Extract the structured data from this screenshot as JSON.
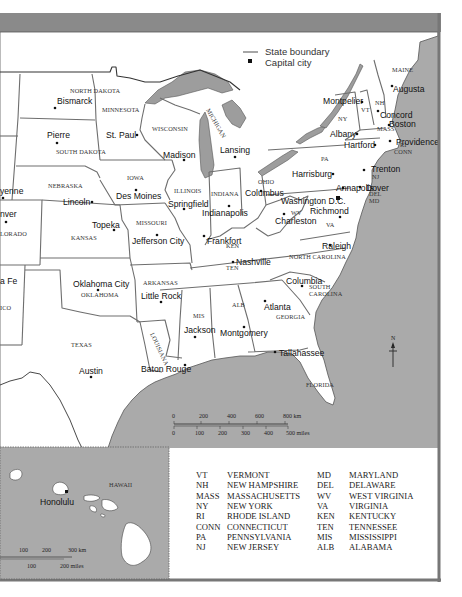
{
  "legend": {
    "items": [
      {
        "icon": "state-boundary-line-icon",
        "label": "State boundary"
      },
      {
        "icon": "capital-city-square-icon",
        "label": "Capital city"
      }
    ]
  },
  "states": [
    {
      "name": "NORTH DAKOTA",
      "x": 70,
      "y": 93
    },
    {
      "name": "SOUTH DAKOTA",
      "x": 56,
      "y": 154
    },
    {
      "name": "MINNESOTA",
      "x": 102,
      "y": 112
    },
    {
      "name": "WISCONSIN",
      "x": 152,
      "y": 131
    },
    {
      "name": "MICHIGAN",
      "x": 206,
      "y": 110,
      "rotate": 60
    },
    {
      "name": "NEBRASKA",
      "x": 48,
      "y": 188
    },
    {
      "name": "IOWA",
      "x": 127,
      "y": 180
    },
    {
      "name": "ILLINOIS",
      "x": 174,
      "y": 193
    },
    {
      "name": "INDIANA",
      "x": 211,
      "y": 196
    },
    {
      "name": "OHIO",
      "x": 258,
      "y": 184
    },
    {
      "name": "PA",
      "x": 321,
      "y": 161
    },
    {
      "name": "NY",
      "x": 338,
      "y": 121
    },
    {
      "name": "VT",
      "x": 361,
      "y": 112
    },
    {
      "name": "NH",
      "x": 375,
      "y": 105
    },
    {
      "name": "MAINE",
      "x": 392,
      "y": 72
    },
    {
      "name": "MASS",
      "x": 377,
      "y": 131
    },
    {
      "name": "RI",
      "x": 400,
      "y": 147
    },
    {
      "name": "CONN",
      "x": 394,
      "y": 154
    },
    {
      "name": "NJ",
      "x": 372,
      "y": 179
    },
    {
      "name": "DEL",
      "x": 369,
      "y": 196
    },
    {
      "name": "MD",
      "x": 369,
      "y": 203
    },
    {
      "name": "WV",
      "x": 291,
      "y": 215
    },
    {
      "name": "VA",
      "x": 326,
      "y": 227
    },
    {
      "name": "KANSAS",
      "x": 71,
      "y": 240
    },
    {
      "name": "MISSOURI",
      "x": 136,
      "y": 225
    },
    {
      "name": "COLORADO",
      "x": 0,
      "y": 235
    },
    {
      "name": "KEN",
      "x": 226,
      "y": 248
    },
    {
      "name": "TEN",
      "x": 226,
      "y": 270
    },
    {
      "name": "NORTH CAROLINA",
      "x": 289,
      "y": 259
    },
    {
      "name": "SOUTH",
      "x": 309,
      "y": 289
    },
    {
      "name": "CAROLINA",
      "x": 309,
      "y": 296
    },
    {
      "name": "GEORGIA",
      "x": 276,
      "y": 319
    },
    {
      "name": "ALB",
      "x": 232,
      "y": 307
    },
    {
      "name": "MIS",
      "x": 193,
      "y": 318
    },
    {
      "name": "ARKANSAS",
      "x": 143,
      "y": 285
    },
    {
      "name": "OKLAHOMA",
      "x": 81,
      "y": 297
    },
    {
      "name": "TEXAS",
      "x": 71,
      "y": 347
    },
    {
      "name": "LOUISIANA",
      "x": 150,
      "y": 334,
      "rotate": 65
    },
    {
      "name": "FLORIDA",
      "x": 306,
      "y": 387
    },
    {
      "name": "ICO",
      "x": 0,
      "y": 309
    }
  ],
  "capitals": [
    {
      "name": "Bismarck",
      "x": 57,
      "y": 104,
      "dx": 55,
      "dy": 108
    },
    {
      "name": "Pierre",
      "x": 47,
      "y": 138,
      "dx": 57,
      "dy": 143
    },
    {
      "name": "St. Paul",
      "x": 106,
      "y": 138,
      "dx": 137,
      "dy": 135
    },
    {
      "name": "Madison",
      "x": 163,
      "y": 158,
      "dx": 184,
      "dy": 160
    },
    {
      "name": "Lansing",
      "x": 220,
      "y": 153,
      "dx": 235,
      "dy": 157
    },
    {
      "name": "Montpelier",
      "x": 323,
      "y": 104,
      "dx": 362,
      "dy": 102
    },
    {
      "name": "Augusta",
      "x": 393,
      "y": 92,
      "dx": 392,
      "dy": 86
    },
    {
      "name": "Concord",
      "x": 380,
      "y": 118,
      "dx": 378,
      "dy": 111
    },
    {
      "name": "Boston",
      "x": 389,
      "y": 127,
      "dx": 389,
      "dy": 125
    },
    {
      "name": "Albany",
      "x": 330,
      "y": 137,
      "dx": 357,
      "dy": 134
    },
    {
      "name": "Hartford",
      "x": 344,
      "y": 148,
      "dx": 375,
      "dy": 145
    },
    {
      "name": "Providence",
      "x": 396,
      "y": 145,
      "dx": 390,
      "dy": 141
    },
    {
      "name": "Harrisburg",
      "x": 292,
      "y": 177,
      "dx": 333,
      "dy": 174
    },
    {
      "name": "Trenton",
      "x": 371,
      "y": 172,
      "dx": 364,
      "dy": 170
    },
    {
      "name": "Annapolis",
      "x": 336,
      "y": 191,
      "dx": 343,
      "dy": 188
    },
    {
      "name": "Dover",
      "x": 366,
      "y": 191,
      "dx": 360,
      "dy": 187
    },
    {
      "name": "Washington D.C.",
      "x": 281,
      "y": 204,
      "dx": 339,
      "dy": 198
    },
    {
      "name": "Richmond",
      "x": 310,
      "y": 214,
      "dx": 340,
      "dy": 217
    },
    {
      "name": "Charleston",
      "x": 275,
      "y": 224,
      "dx": 284,
      "dy": 214
    },
    {
      "name": "Columbus",
      "x": 245,
      "y": 196,
      "dx": 261,
      "dy": 191
    },
    {
      "name": "Indianapolis",
      "x": 202,
      "y": 216,
      "dx": 229,
      "dy": 206
    },
    {
      "name": "Springfield",
      "x": 168,
      "y": 207,
      "dx": 184,
      "dy": 209
    },
    {
      "name": "Des Moines",
      "x": 116,
      "y": 199,
      "dx": 136,
      "dy": 190
    },
    {
      "name": "Lincoln",
      "x": 63,
      "y": 205,
      "dx": 92,
      "dy": 202
    },
    {
      "name": "Topeka",
      "x": 92,
      "y": 228,
      "dx": 114,
      "dy": 230
    },
    {
      "name": "Jefferson City",
      "x": 132,
      "y": 244,
      "dx": 157,
      "dy": 235
    },
    {
      "name": "Frankfort",
      "x": 207,
      "y": 244,
      "dx": 204,
      "dy": 236
    },
    {
      "name": "Nashville",
      "x": 236,
      "y": 265,
      "dx": 233,
      "dy": 262
    },
    {
      "name": "Raleigh",
      "x": 322,
      "y": 249,
      "dx": 330,
      "dy": 245
    },
    {
      "name": "Columbia",
      "x": 286,
      "y": 284,
      "dx": 302,
      "dy": 286
    },
    {
      "name": "Atlanta",
      "x": 264,
      "y": 310,
      "dx": 265,
      "dy": 301
    },
    {
      "name": "Montgomery",
      "x": 220,
      "y": 336,
      "dx": 244,
      "dy": 327
    },
    {
      "name": "Jackson",
      "x": 184,
      "y": 333,
      "dx": 195,
      "dy": 337
    },
    {
      "name": "Little Rock",
      "x": 141,
      "y": 299,
      "dx": 161,
      "dy": 302
    },
    {
      "name": "Oklahoma City",
      "x": 73,
      "y": 287,
      "dx": 98,
      "dy": 290
    },
    {
      "name": "Austin",
      "x": 79,
      "y": 374,
      "dx": 91,
      "dy": 377
    },
    {
      "name": "Baton Rouge",
      "x": 141,
      "y": 372,
      "dx": 185,
      "dy": 365
    },
    {
      "name": "Tallahassee",
      "x": 279,
      "y": 356,
      "dx": 275,
      "dy": 352
    },
    {
      "name": "Cheyenne",
      "x": 0,
      "y": 191,
      "dx": 3,
      "dy": 196
    },
    {
      "name": "Denver",
      "x": 0,
      "y": 219,
      "dx": 6,
      "dy": 221
    },
    {
      "name": "Santa Fe",
      "x": 0,
      "y": 282,
      "dx": 0,
      "dy": 0
    }
  ],
  "partial_labels": {
    "cheyenne": "yenne",
    "denver": "nver",
    "colorado": "LORADO",
    "santa_fe": "a Fe",
    "new_mexico": "ICO"
  },
  "scale_bar": {
    "km_ticks": [
      "0",
      "200",
      "400",
      "600",
      "800 km"
    ],
    "mile_ticks": [
      "0",
      "100",
      "200",
      "300",
      "400",
      "500 miles"
    ]
  },
  "north_arrow": {
    "label": "N"
  },
  "hawaii_inset": {
    "title": "HAWAII",
    "capital": "Honolulu",
    "km_ticks": [
      "100",
      "200",
      "300 km"
    ],
    "mile_ticks": [
      "100",
      "200 miles"
    ]
  },
  "abbreviations": {
    "left": [
      {
        "abbr": "VT",
        "name": "VERMONT"
      },
      {
        "abbr": "NH",
        "name": "NEW HAMPSHIRE"
      },
      {
        "abbr": "MASS",
        "name": "MASSACHUSETTS"
      },
      {
        "abbr": "NY",
        "name": "NEW YORK"
      },
      {
        "abbr": "RI",
        "name": "RHODE ISLAND"
      },
      {
        "abbr": "CONN",
        "name": "CONNECTICUT"
      },
      {
        "abbr": "PA",
        "name": "PENNSYLVANIA"
      },
      {
        "abbr": "NJ",
        "name": "NEW JERSEY"
      }
    ],
    "right": [
      {
        "abbr": "MD",
        "name": "MARYLAND"
      },
      {
        "abbr": "DEL",
        "name": "DELAWARE"
      },
      {
        "abbr": "WV",
        "name": "WEST VIRGINIA"
      },
      {
        "abbr": "VA",
        "name": "VIRGINIA"
      },
      {
        "abbr": "KEN",
        "name": "KENTUCKY"
      },
      {
        "abbr": "TEN",
        "name": "TENNESSEE"
      },
      {
        "abbr": "MIS",
        "name": "MISSISSIPPI"
      },
      {
        "abbr": "ALB",
        "name": "ALABAMA"
      }
    ]
  },
  "colors": {
    "water": "#a9a9a9",
    "land": "#ffffff",
    "border": "#6e6e6e",
    "frame": "#7a7a7a",
    "banner": "#8c8c8c"
  }
}
